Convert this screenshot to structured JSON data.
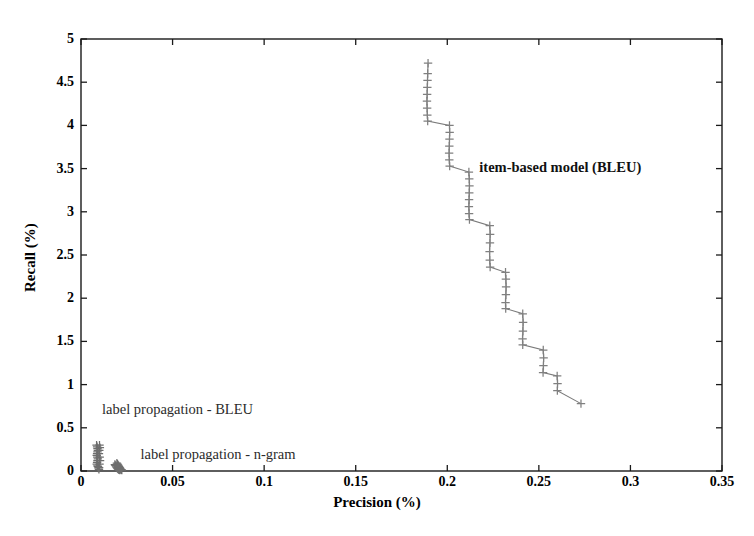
{
  "figure": {
    "background_color": "#ffffff",
    "axis_color": "#1a1a1a",
    "marker_color": "#808080",
    "line_color": "#7a7a7a",
    "cluster_color": "#6e6e6e"
  },
  "chart_data": {
    "type": "scatter",
    "title": "",
    "xlabel": "Precision (%)",
    "ylabel": "Recall (%)",
    "xlim": [
      0,
      0.35
    ],
    "ylim": [
      0,
      5
    ],
    "xticks": [
      "0",
      "0.05",
      "0.1",
      "0.15",
      "0.2",
      "0.25",
      "0.3",
      "0.35"
    ],
    "xtick_values": [
      0,
      0.05,
      0.1,
      0.15,
      0.2,
      0.25,
      0.3,
      0.35
    ],
    "yticks": [
      "0",
      "0.5",
      "1",
      "1.5",
      "2",
      "2.5",
      "3",
      "3.5",
      "4",
      "4.5",
      "5"
    ],
    "ytick_values": [
      0,
      0.5,
      1,
      1.5,
      2,
      2.5,
      3,
      3.5,
      4,
      4.5,
      5
    ],
    "grid": false,
    "legend_position": "inline-annotations",
    "marker_style": "plus",
    "annotations": [
      {
        "text": "item-based model (BLEU)",
        "x": 0.2175,
        "y": 3.52,
        "style": "bold",
        "name": "annotation-item-based-model"
      },
      {
        "text": "label propagation - BLEU",
        "x": 0.0115,
        "y": 0.715,
        "style": "plain",
        "name": "annotation-label-propagation-bleu"
      },
      {
        "text": "label propagation - n-gram",
        "x": 0.0325,
        "y": 0.2,
        "style": "plain",
        "name": "annotation-label-propagation-ngram"
      }
    ],
    "series": [
      {
        "name": "item-based model (BLEU)",
        "marker": "plus",
        "connected": true,
        "color": "#808080",
        "points": [
          [
            0.1895,
            4.72
          ],
          [
            0.1893,
            4.6
          ],
          [
            0.1892,
            4.52
          ],
          [
            0.1891,
            4.44
          ],
          [
            0.189,
            4.36
          ],
          [
            0.1889,
            4.28
          ],
          [
            0.189,
            4.2
          ],
          [
            0.1891,
            4.12
          ],
          [
            0.1893,
            4.05
          ],
          [
            0.2012,
            4.0
          ],
          [
            0.2013,
            3.92
          ],
          [
            0.2012,
            3.84
          ],
          [
            0.2011,
            3.76
          ],
          [
            0.201,
            3.68
          ],
          [
            0.2011,
            3.6
          ],
          [
            0.2013,
            3.53
          ],
          [
            0.2118,
            3.46
          ],
          [
            0.212,
            3.38
          ],
          [
            0.2121,
            3.3
          ],
          [
            0.212,
            3.22
          ],
          [
            0.2119,
            3.14
          ],
          [
            0.2118,
            3.06
          ],
          [
            0.2119,
            2.98
          ],
          [
            0.2121,
            2.91
          ],
          [
            0.2232,
            2.84
          ],
          [
            0.2234,
            2.74
          ],
          [
            0.2233,
            2.64
          ],
          [
            0.2231,
            2.54
          ],
          [
            0.2232,
            2.44
          ],
          [
            0.2234,
            2.36
          ],
          [
            0.2318,
            2.3
          ],
          [
            0.232,
            2.22
          ],
          [
            0.2321,
            2.13
          ],
          [
            0.232,
            2.04
          ],
          [
            0.2318,
            1.95
          ],
          [
            0.2319,
            1.88
          ],
          [
            0.2412,
            1.82
          ],
          [
            0.2414,
            1.72
          ],
          [
            0.2413,
            1.62
          ],
          [
            0.2411,
            1.53
          ],
          [
            0.2412,
            1.46
          ],
          [
            0.2524,
            1.4
          ],
          [
            0.2526,
            1.31
          ],
          [
            0.2525,
            1.22
          ],
          [
            0.2523,
            1.14
          ],
          [
            0.26,
            1.1
          ],
          [
            0.2602,
            1.01
          ],
          [
            0.2601,
            0.93
          ],
          [
            0.273,
            0.78
          ]
        ]
      },
      {
        "name": "label propagation - BLEU",
        "marker": "plus",
        "connected": false,
        "color": "#6e6e6e",
        "points": [
          [
            0.0085,
            0.3
          ],
          [
            0.0088,
            0.28
          ],
          [
            0.009,
            0.26
          ],
          [
            0.0092,
            0.24
          ],
          [
            0.009,
            0.22
          ],
          [
            0.0088,
            0.2
          ],
          [
            0.0086,
            0.18
          ],
          [
            0.0089,
            0.16
          ],
          [
            0.0092,
            0.14
          ],
          [
            0.009,
            0.12
          ],
          [
            0.0088,
            0.1
          ],
          [
            0.0086,
            0.08
          ],
          [
            0.009,
            0.06
          ],
          [
            0.0093,
            0.05
          ],
          [
            0.0095,
            0.035
          ],
          [
            0.0098,
            0.02
          ],
          [
            0.0101,
            0.3
          ],
          [
            0.0103,
            0.27
          ],
          [
            0.01,
            0.24
          ],
          [
            0.0098,
            0.2
          ],
          [
            0.0102,
            0.16
          ],
          [
            0.0104,
            0.12
          ],
          [
            0.0101,
            0.08
          ],
          [
            0.0099,
            0.04
          ]
        ]
      },
      {
        "name": "label propagation - n-gram",
        "marker": "plus",
        "connected": false,
        "color": "#6e6e6e",
        "points": [
          [
            0.0185,
            0.075
          ],
          [
            0.0188,
            0.065
          ],
          [
            0.0191,
            0.055
          ],
          [
            0.0194,
            0.045
          ],
          [
            0.0197,
            0.035
          ],
          [
            0.02,
            0.028
          ],
          [
            0.0203,
            0.022
          ],
          [
            0.0206,
            0.018
          ],
          [
            0.0209,
            0.014
          ],
          [
            0.0212,
            0.01
          ],
          [
            0.0196,
            0.09
          ],
          [
            0.0199,
            0.08
          ],
          [
            0.0202,
            0.07
          ],
          [
            0.0205,
            0.06
          ],
          [
            0.0208,
            0.05
          ],
          [
            0.0211,
            0.04
          ],
          [
            0.0214,
            0.03
          ],
          [
            0.0217,
            0.02
          ],
          [
            0.022,
            0.015
          ],
          [
            0.0223,
            0.01
          ]
        ]
      }
    ]
  }
}
